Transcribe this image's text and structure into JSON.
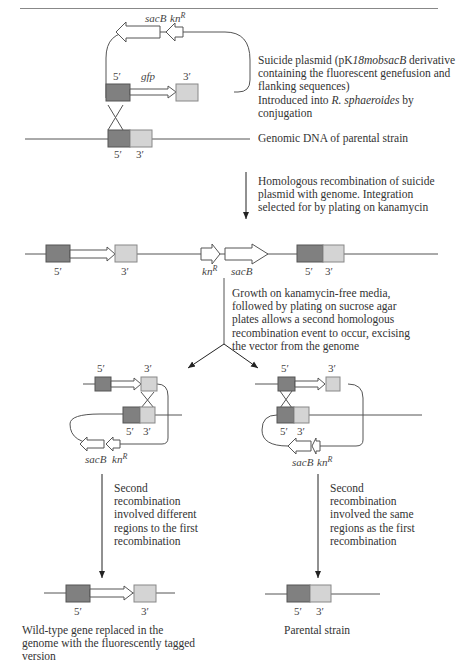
{
  "page": {
    "header_left": "332",
    "header_center": "Scott Magee and Ian Wilson",
    "header_right": "[16]"
  },
  "labels": {
    "sacB": "sacB",
    "knR_base": "kn",
    "knR_sup": "R",
    "gfp": "gfp",
    "five": "5′",
    "three": "3′"
  },
  "captions": {
    "plasmid": {
      "l1a": "Suicide plasmid (pK",
      "l1b": "18mobsacB",
      "l1c": " derivative",
      "l2": "containing the fluorescent genefusion and",
      "l3": "flanking sequences)",
      "l4a": "Introduced into ",
      "l4b": "R. sphaeroides",
      "l4c": " by",
      "l5": "conjugation"
    },
    "genomic": "Genomic DNA of parental strain",
    "step1": {
      "l1": "Homologous recombination of suicide",
      "l2": "plasmid with genome. Integration",
      "l3": "selected for by plating on kanamycin"
    },
    "step2": {
      "l1": "Growth on kanamycin-free media,",
      "l2": "followed by plating on sucrose agar",
      "l3": "plates allows a second homologous",
      "l4": "recombination event to occur, excising",
      "l5": "the vector from the genome"
    },
    "left_branch": {
      "l1": "Second",
      "l2": "recombination",
      "l3": "involved different",
      "l4": "regions to the first",
      "l5": "recombination"
    },
    "right_branch": {
      "l1": "Second",
      "l2": "recombination",
      "l3": "involved the same",
      "l4": "regions as the first",
      "l5": "recombination"
    },
    "left_result": {
      "l1": "Wild-type gene replaced in the",
      "l2": "genome with the fluorescently tagged",
      "l3": "version"
    },
    "right_result": "Parental strain"
  },
  "colors": {
    "five_prime_box": "#808080",
    "three_prime_box": "#d4d4d4",
    "line": "#555555"
  }
}
